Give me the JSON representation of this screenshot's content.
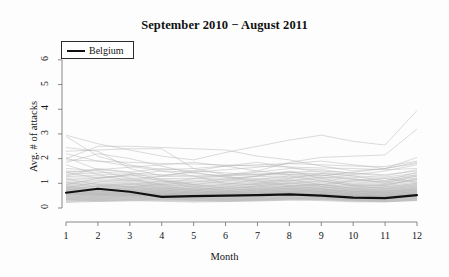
{
  "chart_data": {
    "type": "line",
    "title": "September 2010 − August 2011",
    "xlabel": "Month",
    "ylabel": "Avg. # of attacks",
    "xlim": [
      1,
      12
    ],
    "ylim": [
      0,
      6.4
    ],
    "xticks": [
      1,
      2,
      3,
      4,
      5,
      6,
      7,
      8,
      9,
      10,
      11,
      12
    ],
    "yticks": [
      0,
      1,
      2,
      3,
      4,
      5,
      6
    ],
    "grid": false,
    "legend_position": "top-left",
    "legend": [
      "Belgium"
    ],
    "highlight_color": "#111111",
    "background_series_color": "#b4b4b4",
    "x": [
      1,
      2,
      3,
      4,
      5,
      6,
      7,
      8,
      9,
      10,
      11,
      12
    ],
    "highlight_series": {
      "name": "Belgium",
      "values": [
        0.62,
        0.78,
        0.66,
        0.45,
        0.48,
        0.5,
        0.52,
        0.55,
        0.5,
        0.42,
        0.4,
        0.52
      ]
    },
    "series": [
      {
        "name": "country-01",
        "values": [
          2.95,
          2.6,
          2.35,
          2.1,
          1.95,
          2.25,
          2.5,
          2.75,
          2.95,
          2.7,
          2.55,
          3.95
        ]
      },
      {
        "name": "country-02",
        "values": [
          2.3,
          2.35,
          2.4,
          2.4,
          1.6,
          1.35,
          1.5,
          1.85,
          2.05,
          2.1,
          2.15,
          3.2
        ]
      },
      {
        "name": "country-03",
        "values": [
          2.0,
          2.5,
          2.5,
          2.45,
          2.4,
          2.35,
          2.1,
          1.95,
          1.7,
          1.5,
          1.6,
          2.05
        ]
      },
      {
        "name": "country-04",
        "values": [
          2.9,
          2.1,
          1.75,
          1.55,
          1.6,
          1.7,
          1.75,
          1.8,
          1.75,
          1.7,
          1.68,
          1.9
        ]
      },
      {
        "name": "country-05",
        "values": [
          1.95,
          1.9,
          1.85,
          1.8,
          1.78,
          1.74,
          1.7,
          1.66,
          1.62,
          1.6,
          1.55,
          1.6
        ]
      },
      {
        "name": "country-06",
        "values": [
          2.05,
          1.55,
          1.45,
          1.6,
          1.5,
          1.42,
          1.35,
          1.45,
          1.5,
          1.42,
          1.35,
          1.5
        ]
      },
      {
        "name": "country-07",
        "values": [
          1.5,
          1.45,
          1.4,
          1.35,
          1.3,
          1.34,
          1.38,
          1.42,
          1.4,
          1.3,
          1.25,
          1.42
        ]
      },
      {
        "name": "country-08",
        "values": [
          1.42,
          1.38,
          1.33,
          1.28,
          1.26,
          1.3,
          1.34,
          1.36,
          1.32,
          1.24,
          1.2,
          1.34
        ]
      },
      {
        "name": "country-09",
        "values": [
          1.35,
          1.3,
          1.26,
          1.2,
          1.18,
          1.22,
          1.27,
          1.3,
          1.25,
          1.16,
          1.12,
          1.28
        ]
      },
      {
        "name": "country-10",
        "values": [
          1.28,
          1.24,
          1.2,
          1.14,
          1.12,
          1.16,
          1.2,
          1.24,
          1.2,
          1.1,
          1.06,
          1.22
        ]
      },
      {
        "name": "country-11",
        "values": [
          1.22,
          1.18,
          1.13,
          1.08,
          1.06,
          1.1,
          1.15,
          1.18,
          1.14,
          1.05,
          1.0,
          1.16
        ]
      },
      {
        "name": "country-12",
        "values": [
          1.16,
          1.12,
          1.07,
          1.02,
          1.0,
          1.05,
          1.1,
          1.12,
          1.08,
          1.0,
          0.96,
          1.1
        ]
      },
      {
        "name": "country-13",
        "values": [
          1.1,
          1.06,
          1.02,
          0.97,
          0.95,
          1.0,
          1.04,
          1.07,
          1.03,
          0.95,
          0.91,
          1.05
        ]
      },
      {
        "name": "country-14",
        "values": [
          1.05,
          1.0,
          0.97,
          0.93,
          0.91,
          0.95,
          0.99,
          1.02,
          0.98,
          0.9,
          0.87,
          1.0
        ]
      },
      {
        "name": "country-15",
        "values": [
          1.0,
          0.96,
          0.93,
          0.89,
          0.88,
          0.91,
          0.95,
          0.98,
          0.94,
          0.87,
          0.83,
          0.96
        ]
      },
      {
        "name": "country-16",
        "values": [
          0.96,
          0.92,
          0.89,
          0.85,
          0.84,
          0.87,
          0.91,
          0.94,
          0.9,
          0.83,
          0.8,
          0.92
        ]
      },
      {
        "name": "country-17",
        "values": [
          0.92,
          0.88,
          0.85,
          0.81,
          0.8,
          0.84,
          0.87,
          0.9,
          0.86,
          0.8,
          0.77,
          0.88
        ]
      },
      {
        "name": "country-18",
        "values": [
          0.88,
          0.85,
          0.82,
          0.78,
          0.77,
          0.8,
          0.84,
          0.86,
          0.83,
          0.76,
          0.73,
          0.85
        ]
      },
      {
        "name": "country-19",
        "values": [
          0.85,
          0.81,
          0.78,
          0.75,
          0.74,
          0.77,
          0.8,
          0.83,
          0.79,
          0.73,
          0.7,
          0.81
        ]
      },
      {
        "name": "country-20",
        "values": [
          0.82,
          0.78,
          0.75,
          0.72,
          0.71,
          0.74,
          0.77,
          0.8,
          0.76,
          0.7,
          0.67,
          0.78
        ]
      },
      {
        "name": "country-21",
        "values": [
          0.79,
          0.75,
          0.72,
          0.69,
          0.68,
          0.71,
          0.74,
          0.77,
          0.73,
          0.67,
          0.65,
          0.75
        ]
      },
      {
        "name": "country-22",
        "values": [
          0.76,
          0.72,
          0.7,
          0.66,
          0.65,
          0.68,
          0.71,
          0.74,
          0.7,
          0.65,
          0.62,
          0.72
        ]
      },
      {
        "name": "country-23",
        "values": [
          0.73,
          0.7,
          0.67,
          0.64,
          0.63,
          0.66,
          0.69,
          0.71,
          0.68,
          0.62,
          0.6,
          0.7
        ]
      },
      {
        "name": "country-24",
        "values": [
          0.7,
          0.67,
          0.64,
          0.61,
          0.6,
          0.63,
          0.66,
          0.68,
          0.65,
          0.6,
          0.57,
          0.67
        ]
      },
      {
        "name": "country-25",
        "values": [
          0.68,
          0.64,
          0.62,
          0.59,
          0.58,
          0.61,
          0.63,
          0.66,
          0.63,
          0.58,
          0.55,
          0.64
        ]
      },
      {
        "name": "country-26",
        "values": [
          0.65,
          0.62,
          0.59,
          0.57,
          0.56,
          0.58,
          0.61,
          0.63,
          0.6,
          0.55,
          0.53,
          0.62
        ]
      },
      {
        "name": "country-27",
        "values": [
          0.62,
          0.59,
          0.57,
          0.54,
          0.53,
          0.56,
          0.58,
          0.61,
          0.58,
          0.53,
          0.51,
          0.59
        ]
      },
      {
        "name": "country-28",
        "values": [
          0.6,
          0.57,
          0.55,
          0.52,
          0.51,
          0.54,
          0.56,
          0.58,
          0.55,
          0.51,
          0.49,
          0.57
        ]
      },
      {
        "name": "country-29",
        "values": [
          0.57,
          0.55,
          0.52,
          0.5,
          0.49,
          0.51,
          0.54,
          0.56,
          0.53,
          0.49,
          0.47,
          0.54
        ]
      },
      {
        "name": "country-30",
        "values": [
          0.55,
          0.52,
          0.5,
          0.48,
          0.47,
          0.49,
          0.51,
          0.53,
          0.51,
          0.47,
          0.45,
          0.52
        ]
      },
      {
        "name": "country-31",
        "values": [
          1.6,
          1.52,
          1.2,
          0.95,
          1.05,
          1.18,
          1.3,
          1.45,
          1.35,
          1.15,
          1.05,
          1.35
        ]
      },
      {
        "name": "country-32",
        "values": [
          1.75,
          1.35,
          1.1,
          1.3,
          1.45,
          1.25,
          1.05,
          1.2,
          1.4,
          1.3,
          1.1,
          1.45
        ]
      },
      {
        "name": "country-33",
        "values": [
          1.3,
          1.6,
          1.45,
          1.15,
          0.95,
          1.1,
          1.3,
          1.5,
          1.2,
          0.95,
          0.9,
          1.2
        ]
      },
      {
        "name": "country-34",
        "values": [
          1.45,
          1.2,
          1.35,
          1.5,
          1.3,
          1.0,
          0.95,
          1.1,
          1.25,
          1.2,
          1.0,
          1.3
        ]
      },
      {
        "name": "country-35",
        "values": [
          0.95,
          1.2,
          1.35,
          1.1,
          0.85,
          0.95,
          1.15,
          1.3,
          1.1,
          0.9,
          0.95,
          1.15
        ]
      },
      {
        "name": "country-36",
        "values": [
          1.18,
          0.95,
          0.85,
          1.0,
          1.2,
          1.3,
          1.1,
          0.9,
          0.95,
          1.1,
          1.2,
          1.05
        ]
      },
      {
        "name": "country-37",
        "values": [
          0.8,
          1.05,
          1.15,
          0.9,
          0.75,
          0.85,
          1.0,
          1.15,
          0.95,
          0.8,
          0.85,
          1.0
        ]
      },
      {
        "name": "country-38",
        "values": [
          1.05,
          0.85,
          0.95,
          1.1,
          0.95,
          0.8,
          0.85,
          1.0,
          1.1,
          0.9,
          0.78,
          0.95
        ]
      },
      {
        "name": "country-39",
        "values": [
          0.72,
          0.9,
          1.0,
          0.82,
          0.7,
          0.78,
          0.9,
          1.02,
          0.88,
          0.72,
          0.75,
          0.9
        ]
      },
      {
        "name": "country-40",
        "values": [
          0.9,
          0.74,
          0.82,
          0.95,
          0.85,
          0.72,
          0.76,
          0.88,
          0.95,
          0.8,
          0.7,
          0.85
        ]
      },
      {
        "name": "country-41",
        "values": [
          0.66,
          0.8,
          0.88,
          0.74,
          0.64,
          0.7,
          0.8,
          0.9,
          0.78,
          0.66,
          0.68,
          0.8
        ]
      },
      {
        "name": "country-42",
        "values": [
          0.84,
          0.68,
          0.74,
          0.86,
          0.78,
          0.66,
          0.7,
          0.8,
          0.86,
          0.74,
          0.64,
          0.78
        ]
      },
      {
        "name": "country-43",
        "values": [
          0.6,
          0.72,
          0.8,
          0.68,
          0.6,
          0.64,
          0.73,
          0.82,
          0.72,
          0.61,
          0.62,
          0.73
        ]
      },
      {
        "name": "country-44",
        "values": [
          0.78,
          0.63,
          0.68,
          0.79,
          0.72,
          0.61,
          0.65,
          0.74,
          0.79,
          0.68,
          0.6,
          0.72
        ]
      },
      {
        "name": "country-45",
        "values": [
          0.55,
          0.66,
          0.73,
          0.62,
          0.55,
          0.59,
          0.67,
          0.75,
          0.66,
          0.56,
          0.57,
          0.67
        ]
      },
      {
        "name": "country-46",
        "values": [
          0.71,
          0.58,
          0.63,
          0.72,
          0.66,
          0.57,
          0.6,
          0.68,
          0.73,
          0.63,
          0.55,
          0.66
        ]
      },
      {
        "name": "country-47",
        "values": [
          0.5,
          0.6,
          0.67,
          0.57,
          0.51,
          0.55,
          0.62,
          0.69,
          0.61,
          0.52,
          0.52,
          0.62
        ]
      },
      {
        "name": "country-48",
        "values": [
          0.66,
          0.54,
          0.58,
          0.66,
          0.61,
          0.53,
          0.56,
          0.63,
          0.67,
          0.58,
          0.51,
          0.61
        ]
      },
      {
        "name": "country-49",
        "values": [
          0.46,
          0.55,
          0.61,
          0.52,
          0.47,
          0.5,
          0.57,
          0.63,
          0.56,
          0.48,
          0.48,
          0.57
        ]
      },
      {
        "name": "country-50",
        "values": [
          0.61,
          0.5,
          0.54,
          0.61,
          0.56,
          0.49,
          0.52,
          0.58,
          0.62,
          0.54,
          0.47,
          0.56
        ]
      },
      {
        "name": "country-51",
        "values": [
          0.43,
          0.51,
          0.56,
          0.48,
          0.44,
          0.47,
          0.53,
          0.58,
          0.52,
          0.45,
          0.45,
          0.53
        ]
      },
      {
        "name": "country-52",
        "values": [
          0.57,
          0.47,
          0.5,
          0.57,
          0.52,
          0.46,
          0.48,
          0.54,
          0.57,
          0.5,
          0.44,
          0.52
        ]
      },
      {
        "name": "country-53",
        "values": [
          0.4,
          0.47,
          0.52,
          0.45,
          0.41,
          0.44,
          0.49,
          0.54,
          0.48,
          0.42,
          0.42,
          0.49
        ]
      },
      {
        "name": "country-54",
        "values": [
          0.53,
          0.44,
          0.47,
          0.53,
          0.49,
          0.43,
          0.45,
          0.5,
          0.53,
          0.46,
          0.41,
          0.48
        ]
      },
      {
        "name": "country-55",
        "values": [
          0.37,
          0.44,
          0.48,
          0.42,
          0.38,
          0.41,
          0.45,
          0.5,
          0.45,
          0.39,
          0.39,
          0.46
        ]
      },
      {
        "name": "country-56",
        "values": [
          0.5,
          0.41,
          0.44,
          0.5,
          0.46,
          0.4,
          0.42,
          0.47,
          0.5,
          0.43,
          0.38,
          0.45
        ]
      },
      {
        "name": "country-57",
        "values": [
          0.34,
          0.4,
          0.44,
          0.39,
          0.36,
          0.38,
          0.42,
          0.46,
          0.42,
          0.36,
          0.36,
          0.43
        ]
      },
      {
        "name": "country-58",
        "values": [
          0.46,
          0.38,
          0.41,
          0.46,
          0.43,
          0.37,
          0.39,
          0.44,
          0.46,
          0.4,
          0.35,
          0.42
        ]
      },
      {
        "name": "country-59",
        "values": [
          0.31,
          0.37,
          0.41,
          0.36,
          0.33,
          0.35,
          0.39,
          0.43,
          0.39,
          0.34,
          0.33,
          0.4
        ]
      },
      {
        "name": "country-60",
        "values": [
          0.43,
          0.35,
          0.38,
          0.43,
          0.4,
          0.35,
          0.36,
          0.41,
          0.43,
          0.37,
          0.32,
          0.39
        ]
      },
      {
        "name": "country-61",
        "values": [
          0.28,
          0.34,
          0.37,
          0.33,
          0.3,
          0.32,
          0.36,
          0.4,
          0.36,
          0.31,
          0.3,
          0.37
        ]
      },
      {
        "name": "country-62",
        "values": [
          0.4,
          0.32,
          0.35,
          0.4,
          0.37,
          0.32,
          0.34,
          0.38,
          0.4,
          0.34,
          0.3,
          0.36
        ]
      },
      {
        "name": "country-63",
        "values": [
          0.25,
          0.3,
          0.34,
          0.3,
          0.27,
          0.29,
          0.33,
          0.37,
          0.33,
          0.28,
          0.27,
          0.34
        ]
      },
      {
        "name": "country-64",
        "values": [
          0.36,
          0.29,
          0.32,
          0.36,
          0.34,
          0.29,
          0.31,
          0.35,
          0.37,
          0.32,
          0.27,
          0.33
        ]
      },
      {
        "name": "country-65",
        "values": [
          0.22,
          0.27,
          0.3,
          0.27,
          0.24,
          0.26,
          0.3,
          0.33,
          0.3,
          0.25,
          0.25,
          0.31
        ]
      },
      {
        "name": "country-66",
        "values": [
          0.33,
          0.27,
          0.29,
          0.33,
          0.31,
          0.27,
          0.28,
          0.32,
          0.34,
          0.29,
          0.25,
          0.3
        ]
      },
      {
        "name": "country-67",
        "values": [
          2.2,
          1.9,
          1.7,
          1.5,
          1.45,
          1.55,
          1.65,
          1.8,
          1.9,
          1.75,
          1.6,
          1.85
        ]
      },
      {
        "name": "country-68",
        "values": [
          1.85,
          2.2,
          2.0,
          1.7,
          1.4,
          1.3,
          1.45,
          1.6,
          1.55,
          1.4,
          1.3,
          1.55
        ]
      },
      {
        "name": "country-69",
        "values": [
          2.45,
          2.3,
          1.6,
          1.3,
          1.5,
          1.7,
          1.85,
          1.65,
          1.45,
          1.35,
          1.5,
          1.75
        ]
      },
      {
        "name": "country-70",
        "values": [
          1.45,
          1.55,
          1.65,
          1.75,
          1.85,
          1.7,
          1.5,
          1.35,
          1.3,
          1.45,
          1.6,
          1.8
        ]
      }
    ]
  },
  "legend": {
    "label": "Belgium"
  },
  "axes": {
    "x_tick_labels": [
      "1",
      "2",
      "3",
      "4",
      "5",
      "6",
      "7",
      "8",
      "9",
      "10",
      "11",
      "12"
    ],
    "y_tick_labels": [
      "0",
      "1",
      "2",
      "3",
      "4",
      "5",
      "6"
    ],
    "x_title": "Month",
    "y_title": "Avg. # of attacks"
  },
  "title": "September 2010 − August 2011"
}
